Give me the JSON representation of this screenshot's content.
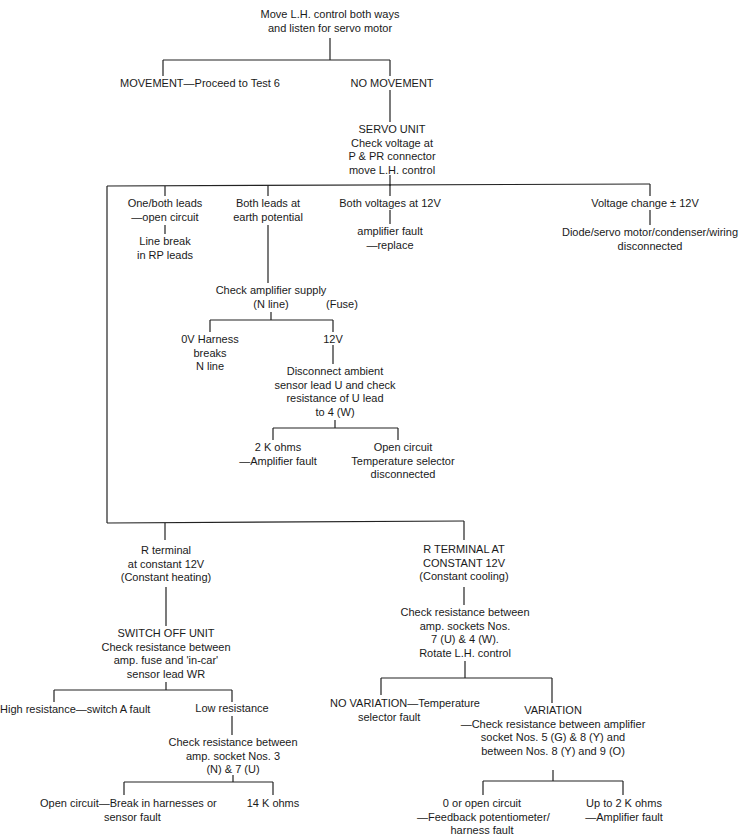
{
  "diagram": {
    "type": "fault-finding flowchart",
    "nodes": {
      "start": {
        "lines": [
          "Move L.H. control both ways",
          "and listen for servo motor"
        ]
      },
      "movement": {
        "lines": [
          "MOVEMENT—Proceed to Test 6"
        ]
      },
      "no_movement": {
        "lines": [
          "NO MOVEMENT"
        ]
      },
      "servo_unit": {
        "lines": [
          "SERVO UNIT",
          "Check voltage at",
          "P & PR connector",
          "move L.H. control"
        ]
      },
      "one_both_leads": {
        "lines": [
          "One/both leads",
          "—open circuit"
        ]
      },
      "line_break": {
        "lines": [
          "Line break",
          "in RP leads"
        ]
      },
      "both_leads_earth": {
        "lines": [
          "Both leads at",
          "earth potential"
        ]
      },
      "both_voltages_12v": {
        "lines": [
          "Both voltages at 12V"
        ]
      },
      "amplifier_fault_replace": {
        "lines": [
          "amplifier fault",
          "—replace"
        ]
      },
      "voltage_change": {
        "lines": [
          "Voltage change ± 12V"
        ]
      },
      "diode_servo": {
        "lines": [
          "Diode/servo motor/condenser/wiring",
          "disconnected"
        ]
      },
      "check_amp_supply": {
        "lines": [
          "Check amplifier supply",
          "(N line)"
        ]
      },
      "fuse": {
        "lines": [
          "(Fuse)"
        ]
      },
      "ov_harness": {
        "lines": [
          "0V Harness",
          "breaks",
          "N line"
        ]
      },
      "twelve_v": {
        "lines": [
          "12V"
        ]
      },
      "disconnect_ambient": {
        "lines": [
          "Disconnect ambient",
          "sensor lead U and check",
          "resistance of U lead",
          "to 4 (W)"
        ]
      },
      "two_k_ohms": {
        "lines": [
          "2 K ohms",
          "—Amplifier fault"
        ]
      },
      "open_circuit_temp": {
        "lines": [
          "Open circuit",
          "Temperature selector",
          "disconnected"
        ]
      },
      "r_terminal_heating": {
        "lines": [
          "R terminal",
          "at constant 12V",
          "(Constant heating)"
        ]
      },
      "r_terminal_cooling": {
        "lines": [
          "R TERMINAL AT",
          "CONSTANT 12V",
          "(Constant cooling)"
        ]
      },
      "switch_off_unit": {
        "lines": [
          "SWITCH OFF UNIT",
          "Check resistance between",
          "amp. fuse and 'in-car'",
          "sensor lead WR"
        ]
      },
      "high_resistance": {
        "lines": [
          "High resistance—switch A fault"
        ]
      },
      "low_resistance": {
        "lines": [
          "Low resistance"
        ]
      },
      "check_socket_3_7": {
        "lines": [
          "Check resistance between",
          "amp. socket Nos. 3",
          "(N) & 7 (U)"
        ]
      },
      "open_circuit_break": {
        "lines": [
          "Open circuit—Break in harnesses or",
          "sensor fault"
        ]
      },
      "fourteen_k": {
        "lines": [
          "14 K ohms"
        ]
      },
      "check_sockets_7_4": {
        "lines": [
          "Check resistance between",
          "amp. sockets Nos.",
          "7 (U) & 4 (W).",
          "Rotate L.H. control"
        ]
      },
      "no_variation": {
        "lines": [
          "NO VARIATION—Temperature",
          "selector fault"
        ]
      },
      "variation": {
        "lines": [
          "VARIATION",
          "—Check resistance between amplifier",
          "socket Nos. 5 (G) & 8 (Y) and",
          "between Nos. 8 (Y) and 9 (O)"
        ]
      },
      "zero_open": {
        "lines": [
          "0 or open circuit",
          "—Feedback potentiometer/",
          "harness fault"
        ]
      },
      "up_to_2k": {
        "lines": [
          "Up to 2 K ohms",
          "—Amplifier fault"
        ]
      }
    },
    "line_color": "#222222",
    "background": "#ffffff"
  }
}
